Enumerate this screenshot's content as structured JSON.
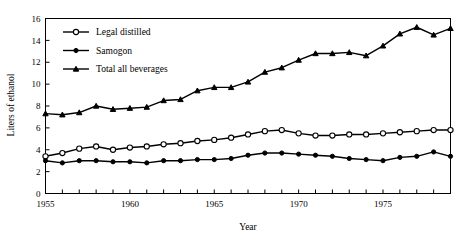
{
  "chart_data": {
    "type": "line",
    "title": "",
    "xlabel": "Year",
    "ylabel": "Liters of ethanol",
    "xlim": [
      1955,
      1979
    ],
    "ylim": [
      0,
      16
    ],
    "xticks": [
      1955,
      1960,
      1965,
      1970,
      1975
    ],
    "xtick_labels": [
      "1955",
      "1960",
      "1965",
      "1970",
      "1975"
    ],
    "yticks": [
      0,
      2,
      4,
      6,
      8,
      10,
      12,
      14,
      16
    ],
    "ytick_labels": [
      "0",
      "2",
      "4",
      "6",
      "8",
      "10",
      "12",
      "14",
      "16"
    ],
    "grid": false,
    "legend_position": "upper left",
    "x": [
      1955,
      1956,
      1957,
      1958,
      1959,
      1960,
      1961,
      1962,
      1963,
      1964,
      1965,
      1966,
      1967,
      1968,
      1969,
      1970,
      1971,
      1972,
      1973,
      1974,
      1975,
      1976,
      1977,
      1978,
      1979
    ],
    "series": [
      {
        "name": "Legal distilled",
        "marker": "open-circle",
        "values": [
          3.4,
          3.7,
          4.1,
          4.3,
          4.0,
          4.2,
          4.3,
          4.5,
          4.6,
          4.8,
          4.9,
          5.1,
          5.4,
          5.7,
          5.8,
          5.5,
          5.3,
          5.3,
          5.4,
          5.4,
          5.5,
          5.6,
          5.7,
          5.8,
          5.8
        ]
      },
      {
        "name": "Samogon",
        "marker": "filled-circle",
        "values": [
          3.0,
          2.8,
          3.0,
          3.0,
          2.9,
          2.9,
          2.8,
          3.0,
          3.0,
          3.1,
          3.1,
          3.2,
          3.5,
          3.7,
          3.7,
          3.6,
          3.5,
          3.4,
          3.2,
          3.1,
          3.0,
          3.3,
          3.4,
          3.8,
          3.4
        ]
      },
      {
        "name": "Total all beverages",
        "marker": "filled-triangle",
        "values": [
          7.3,
          7.2,
          7.4,
          8.0,
          7.7,
          7.8,
          7.9,
          8.5,
          8.6,
          9.4,
          9.7,
          9.7,
          10.2,
          11.1,
          11.5,
          12.2,
          12.8,
          12.8,
          12.9,
          12.6,
          13.5,
          14.6,
          15.2,
          14.5,
          15.1
        ]
      }
    ]
  },
  "axes": {
    "xlabel": "Year",
    "ylabel": "Liters of ethanol"
  },
  "legend": {
    "items": [
      {
        "label": "Legal distilled"
      },
      {
        "label": "Samogon"
      },
      {
        "label": "Total all beverages"
      }
    ]
  }
}
